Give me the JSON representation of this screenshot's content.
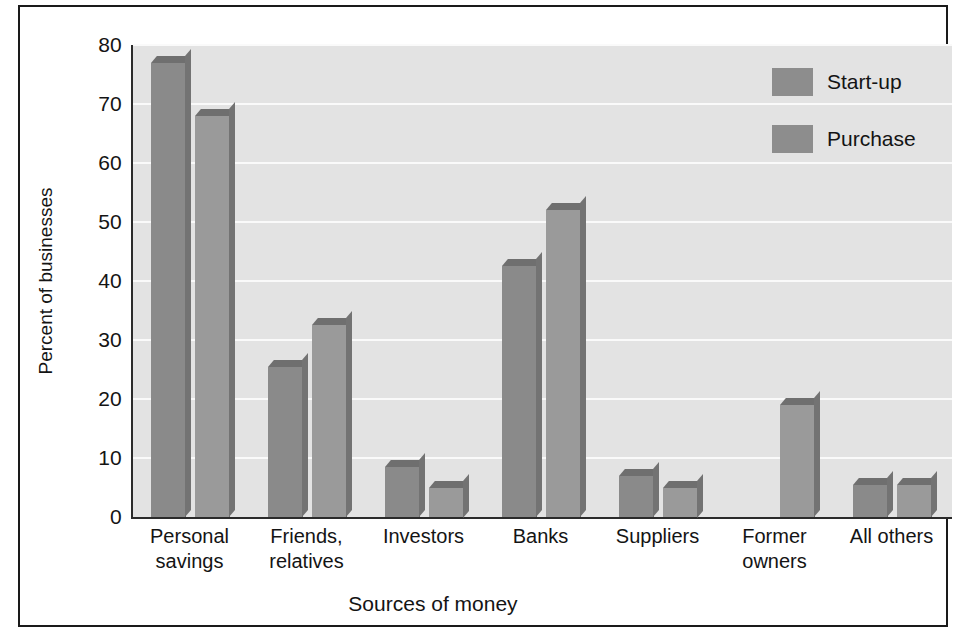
{
  "chart_data": {
    "type": "bar",
    "title": "",
    "xlabel": "Sources of money",
    "ylabel": "Percent of businesses",
    "ylim": [
      0,
      80
    ],
    "yticks": [
      0,
      10,
      20,
      30,
      40,
      50,
      60,
      70,
      80
    ],
    "grid": true,
    "legend_position": "top-right",
    "categories": [
      "Personal\nsavings",
      "Friends,\nrelatives",
      "Investors",
      "Banks",
      "Suppliers",
      "Former\nowners",
      "All others"
    ],
    "category_lines": [
      [
        "Personal",
        "savings"
      ],
      [
        "Friends,",
        "relatives"
      ],
      [
        "Investors",
        ""
      ],
      [
        "Banks",
        ""
      ],
      [
        "Suppliers",
        ""
      ],
      [
        "Former",
        "owners"
      ],
      [
        "All others",
        ""
      ]
    ],
    "series": [
      {
        "name": "Start-up",
        "color": "#8a8a8a",
        "values": [
          77,
          25.5,
          8.5,
          42.5,
          7,
          0,
          5.5
        ]
      },
      {
        "name": "Purchase",
        "color": "#9a9a9a",
        "values": [
          68,
          32.5,
          5,
          52,
          5,
          19,
          5.5
        ]
      }
    ]
  },
  "legend": {
    "items": [
      {
        "label": "Start-up",
        "color": "#8d8d8d"
      },
      {
        "label": "Purchase",
        "color": "#8d8d8d"
      }
    ]
  },
  "axis": {
    "y_ticks": [
      "80",
      "70",
      "60",
      "50",
      "40",
      "30",
      "20",
      "10",
      "0"
    ],
    "y_title": "Percent of businesses",
    "x_title": "Sources of money"
  }
}
